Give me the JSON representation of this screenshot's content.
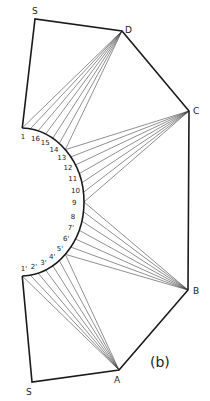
{
  "figure": {
    "caption": "(b)",
    "vertices": {
      "S_top": {
        "label": "S",
        "x": 35,
        "y": 19,
        "lx": 32,
        "ly": 14
      },
      "D": {
        "label": "D",
        "x": 122,
        "y": 31,
        "lx": 125,
        "ly": 33
      },
      "C": {
        "label": "C",
        "x": 189,
        "y": 111,
        "lx": 193,
        "ly": 114
      },
      "B": {
        "label": "B",
        "x": 188,
        "y": 290,
        "lx": 193,
        "ly": 294
      },
      "A": {
        "label": "A",
        "x": 119,
        "y": 370,
        "lx": 114,
        "ly": 383
      },
      "S_bottom": {
        "label": "S",
        "x": 32,
        "y": 382,
        "lx": 26,
        "ly": 395
      }
    },
    "arc": {
      "cx": 20,
      "cy": 202,
      "rx": 64,
      "ry": 74
    },
    "upper_labels": [
      "1",
      "16",
      "15",
      "14",
      "13",
      "12",
      "11",
      "10",
      "9"
    ],
    "lower_labels": [
      "1'",
      "2'",
      "3'",
      "4'",
      "5'",
      "6'",
      "7'",
      "8"
    ]
  }
}
